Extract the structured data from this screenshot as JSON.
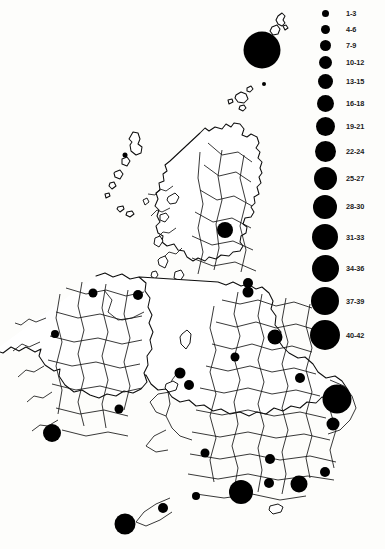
{
  "figure": {
    "type": "proportional-symbol-map",
    "region": "British Isles (United Kingdom and Ireland)",
    "background_color": "#fdfdfb",
    "symbol_color": "#000000",
    "outline_color": "#0d0d0d"
  },
  "legend": {
    "title": "",
    "position": "top-right",
    "entries": [
      {
        "label": "1-3",
        "diameter_px": 7,
        "min": 1,
        "max": 3,
        "y": 12
      },
      {
        "label": "4-6",
        "diameter_px": 9,
        "min": 4,
        "max": 6,
        "y": 33
      },
      {
        "label": "7-9",
        "diameter_px": 11,
        "min": 7,
        "max": 9,
        "y": 55
      },
      {
        "label": "10-12",
        "diameter_px": 13,
        "min": 10,
        "max": 12,
        "y": 78
      },
      {
        "label": "13-15",
        "diameter_px": 15,
        "min": 13,
        "max": 15,
        "y": 101
      },
      {
        "label": "16-18",
        "diameter_px": 17,
        "min": 16,
        "max": 18,
        "y": 125
      },
      {
        "label": "19-21",
        "diameter_px": 19,
        "min": 19,
        "max": 21,
        "y": 150
      },
      {
        "label": "22-24",
        "diameter_px": 21,
        "min": 22,
        "max": 24,
        "y": 176
      },
      {
        "label": "25-27",
        "diameter_px": 23,
        "min": 25,
        "max": 27,
        "y": 203
      },
      {
        "label": "28-30",
        "diameter_px": 24,
        "min": 28,
        "max": 30,
        "y": 231
      },
      {
        "label": "31-33",
        "diameter_px": 26,
        "min": 31,
        "max": 33,
        "y": 259
      },
      {
        "label": "34-36",
        "diameter_px": 27,
        "min": 34,
        "max": 36,
        "y": 252
      },
      {
        "label": "37-39",
        "diameter_px": 28,
        "min": 37,
        "max": 39,
        "y": 276
      },
      {
        "label": "40-42",
        "diameter_px": 30,
        "min": 40,
        "max": 42,
        "y": 300
      }
    ]
  },
  "chart_data": {
    "type": "scatter",
    "title": "",
    "xlabel": "",
    "ylabel": "",
    "symbol_encoding": "circle area proportional to count class",
    "points": [
      {
        "name": "shetland",
        "x": 262,
        "y": 50,
        "d": 37,
        "class": "40-42"
      },
      {
        "name": "orkney",
        "x": 264,
        "y": 84,
        "d": 4,
        "class": "1-3"
      },
      {
        "name": "outer-hebrides",
        "x": 125,
        "y": 155,
        "d": 5,
        "class": "1-3"
      },
      {
        "name": "central-scotland",
        "x": 225,
        "y": 230,
        "d": 16,
        "class": "16-18"
      },
      {
        "name": "lothian-borders",
        "x": 248,
        "y": 283,
        "d": 10,
        "class": "7-9"
      },
      {
        "name": "northumberland",
        "x": 248,
        "y": 292,
        "d": 11,
        "class": "10-12"
      },
      {
        "name": "north-yorkshire",
        "x": 275,
        "y": 337,
        "d": 15,
        "class": "13-15"
      },
      {
        "name": "cumbria",
        "x": 235,
        "y": 357,
        "d": 9,
        "class": "4-6"
      },
      {
        "name": "east-yorkshire",
        "x": 300,
        "y": 378,
        "d": 10,
        "class": "7-9"
      },
      {
        "name": "merseyside",
        "x": 180,
        "y": 373,
        "d": 11,
        "class": "10-12"
      },
      {
        "name": "north-wales",
        "x": 189,
        "y": 385,
        "d": 10,
        "class": "7-9"
      },
      {
        "name": "east-anglia",
        "x": 337,
        "y": 399,
        "d": 29,
        "class": "34-36"
      },
      {
        "name": "suffolk",
        "x": 333,
        "y": 424,
        "d": 13,
        "class": "13-15"
      },
      {
        "name": "midlands",
        "x": 205,
        "y": 453,
        "d": 9,
        "class": "4-6"
      },
      {
        "name": "oxfordshire",
        "x": 270,
        "y": 459,
        "d": 10,
        "class": "7-9"
      },
      {
        "name": "kent",
        "x": 325,
        "y": 472,
        "d": 10,
        "class": "7-9"
      },
      {
        "name": "hampshire",
        "x": 269,
        "y": 483,
        "d": 10,
        "class": "7-9"
      },
      {
        "name": "sussex",
        "x": 299,
        "y": 484,
        "d": 17,
        "class": "16-18"
      },
      {
        "name": "somerset",
        "x": 241,
        "y": 492,
        "d": 24,
        "class": "25-27"
      },
      {
        "name": "south-wales",
        "x": 196,
        "y": 496,
        "d": 8,
        "class": "4-6"
      },
      {
        "name": "devon",
        "x": 163,
        "y": 508,
        "d": 10,
        "class": "7-9"
      },
      {
        "name": "cornwall-scilly",
        "x": 125,
        "y": 524,
        "d": 21,
        "class": "22-24"
      },
      {
        "name": "donegal",
        "x": 93,
        "y": 293,
        "d": 9,
        "class": "4-6"
      },
      {
        "name": "antrim",
        "x": 138,
        "y": 295,
        "d": 10,
        "class": "7-9"
      },
      {
        "name": "mayo",
        "x": 55,
        "y": 334,
        "d": 8,
        "class": "4-6"
      },
      {
        "name": "wexford",
        "x": 119,
        "y": 409,
        "d": 9,
        "class": "4-6"
      },
      {
        "name": "cork",
        "x": 52,
        "y": 433,
        "d": 18,
        "class": "19-21"
      }
    ]
  }
}
